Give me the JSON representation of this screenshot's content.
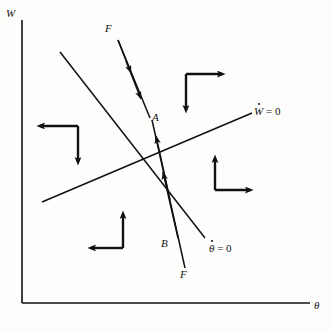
{
  "figure": {
    "type": "phase-plane-diagram",
    "axes": {
      "y_label": "W",
      "x_label": "θ",
      "origin": [
        22,
        303
      ],
      "x_axis_end": [
        310,
        303
      ],
      "y_axis_top": [
        22,
        20
      ]
    },
    "nullclines": [
      {
        "name": "w-dot-nullcline",
        "label": "W",
        "label_suffix": " = 0",
        "dotted": true,
        "slope": "positive-shallow",
        "from": [
          42,
          202
        ],
        "to": [
          252,
          113
        ]
      },
      {
        "name": "theta-dot-nullcline",
        "label": "θ",
        "label_suffix": " = 0",
        "dotted": true,
        "slope": "negative-steep",
        "from": [
          60,
          52
        ],
        "to": [
          205,
          238
        ]
      }
    ],
    "equilibrium": {
      "label": "A",
      "position": [
        152,
        118
      ]
    },
    "trajectories": [
      {
        "name": "incoming-upper-trajectory",
        "label": "F",
        "label_position": [
          105,
          28
        ],
        "direction": "toward-A-from-upper-left",
        "arrowheads": 2
      },
      {
        "name": "incoming-lower-trajectory",
        "label_upper": "B",
        "label_lower": "F",
        "label_upper_position": [
          163,
          243
        ],
        "label_lower_position": [
          181,
          274
        ],
        "direction": "toward-A-from-lower-right",
        "arrowheads": 2
      }
    ],
    "direction_fields": [
      {
        "name": "quadrant-arrows-upper-left",
        "horizontal": "left",
        "vertical": "down",
        "corner": [
          78,
          126
        ]
      },
      {
        "name": "quadrant-arrows-upper-right",
        "horizontal": "right",
        "vertical": "down",
        "corner": [
          186,
          74
        ]
      },
      {
        "name": "quadrant-arrows-lower-right",
        "horizontal": "right",
        "vertical": "up",
        "corner": [
          215,
          190
        ]
      },
      {
        "name": "quadrant-arrows-lower-left",
        "horizontal": "left",
        "vertical": "up",
        "corner": [
          123,
          248
        ]
      }
    ],
    "colors": {
      "ink": "#111111",
      "background": "#fdfdfb"
    }
  }
}
